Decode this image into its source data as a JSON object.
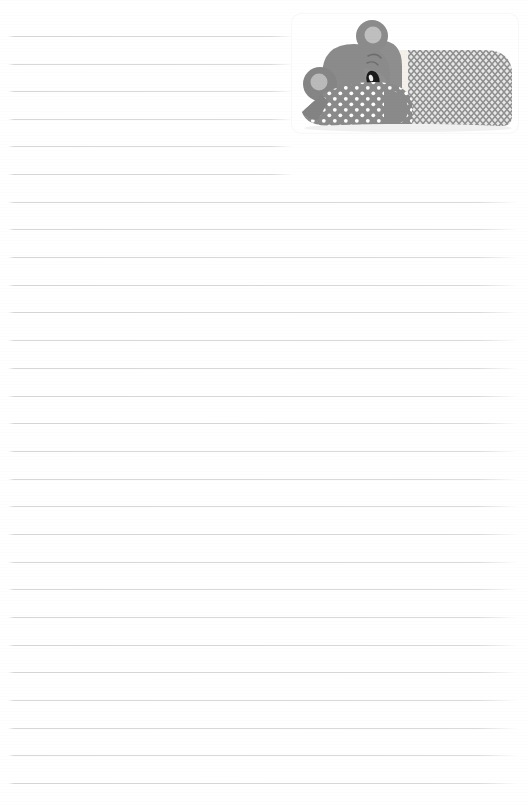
{
  "page": {
    "kind": "lined-notepad-page",
    "width": 528,
    "height": 805,
    "background_color": "#ffffff"
  },
  "ruled_lines": {
    "label": "Ruled writing lines",
    "color": "#dcdcdc",
    "thickness_px": 1,
    "spacing_px": 27.8,
    "count": 28,
    "left_x": 8,
    "full_right_x": 518,
    "short_right_x": 293,
    "short_line_count": 6,
    "y_positions": [
      36,
      64,
      91,
      119,
      146,
      174,
      202,
      229,
      257,
      285,
      312,
      340,
      368,
      396,
      423,
      451,
      479,
      506,
      534,
      562,
      589,
      617,
      645,
      672,
      700,
      728,
      755,
      783
    ]
  },
  "illustration": {
    "name": "sleeping-koala",
    "description": "Grey koala sleeping on a polka dot pillow under a chevron blanket",
    "card": {
      "name": "illustration-card",
      "color": "#ffffff",
      "x": 292,
      "y": 14,
      "width": 226,
      "height": 119,
      "corner_radius": 9
    },
    "colors": {
      "koala_body": "#8c8c8c",
      "koala_body_dark": "#7e7e7e",
      "koala_highlight": "#b4b4b4",
      "ear_inner": "#bdbdbd",
      "nose": "#1d1d1d",
      "nose_highlight": "#ffffff",
      "pillow": "#8a8a8a",
      "pillow_dots": "#ffffff",
      "blanket_band": "#f2f0ea",
      "blanket_chevron_light": "#e2e2e2",
      "blanket_chevron_dark": "#909090",
      "card_shadow": "#f8f8f8"
    },
    "parts": [
      {
        "name": "koala-head",
        "label": "Head"
      },
      {
        "name": "koala-top-ear",
        "label": "Top ear"
      },
      {
        "name": "koala-left-ear",
        "label": "Left ear"
      },
      {
        "name": "koala-nose",
        "label": "Nose"
      },
      {
        "name": "koala-eye",
        "label": "Closed sleeping eye"
      },
      {
        "name": "koala-arm",
        "label": "Arm"
      },
      {
        "name": "polka-dot-pillow",
        "label": "Polka dot pillow"
      },
      {
        "name": "chevron-blanket",
        "label": "Chevron blanket"
      },
      {
        "name": "blanket-cuff",
        "label": "Blanket cuff band"
      }
    ]
  }
}
